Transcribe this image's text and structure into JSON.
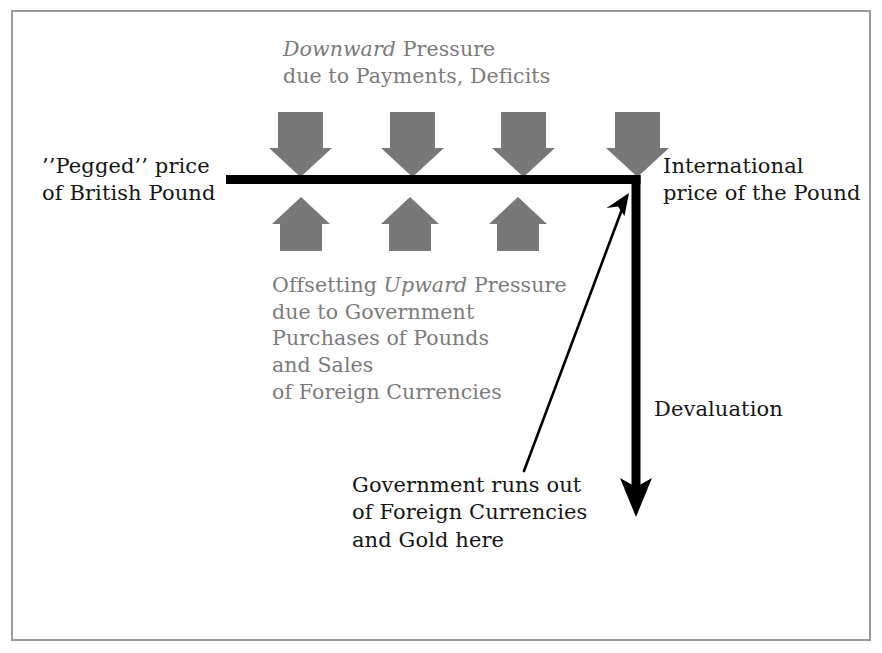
{
  "diagram": {
    "colors": {
      "arrow_gray": "#787878",
      "text_gray": "#7b7b7b",
      "text_black": "#161616",
      "line_black": "#000000",
      "frame_gray": "#9a9a9a",
      "background": "#ffffff"
    },
    "labels": {
      "downward_pressure": {
        "line1_italic": "Downward",
        "line1_rest": " Pressure",
        "line2": "due to Payments, Deficits"
      },
      "pegged_price": {
        "line1": "’’Pegged’’ price",
        "line2": "of British Pound"
      },
      "international_price": {
        "line1": "International",
        "line2": "price of the Pound"
      },
      "offsetting_pressure": {
        "line1_pre": "Offsetting ",
        "line1_italic": "Upward",
        "line1_post": " Pressure",
        "line2": "due to Government",
        "line3": "Purchases of Pounds",
        "line4": "and Sales",
        "line5": "of Foreign Currencies"
      },
      "devaluation": "Devaluation",
      "government_runs_out": {
        "line1": "Government runs out",
        "line2": "of Foreign Currencies",
        "line3": "and Gold here"
      }
    },
    "shapes": {
      "down_arrows": {
        "name": "downward-pressure-arrow",
        "count": 4,
        "centers_x": [
          300,
          412,
          523,
          637
        ],
        "top_y": 112,
        "tip_y": 177
      },
      "up_arrows": {
        "name": "upward-pressure-arrow",
        "count": 3,
        "centers_x": [
          301,
          410,
          518
        ],
        "tip_y": 197,
        "bottom_y": 251
      },
      "peg_line": {
        "name": "pegged-price-line",
        "x_start": 226,
        "x_end": 640,
        "y": 179,
        "thickness": 9
      },
      "devaluation_arrow": {
        "name": "devaluation-arrow",
        "x": 636,
        "y_start": 179,
        "y_tip": 517,
        "thickness": 9
      },
      "pointer_arrow": {
        "name": "runs-out-pointer-arrow",
        "x_start": 524,
        "y_start": 471,
        "x_tip": 629,
        "y_tip": 193
      },
      "frame": {
        "name": "diagram-frame",
        "x": 11,
        "y": 10,
        "width": 860,
        "height": 631
      }
    }
  }
}
